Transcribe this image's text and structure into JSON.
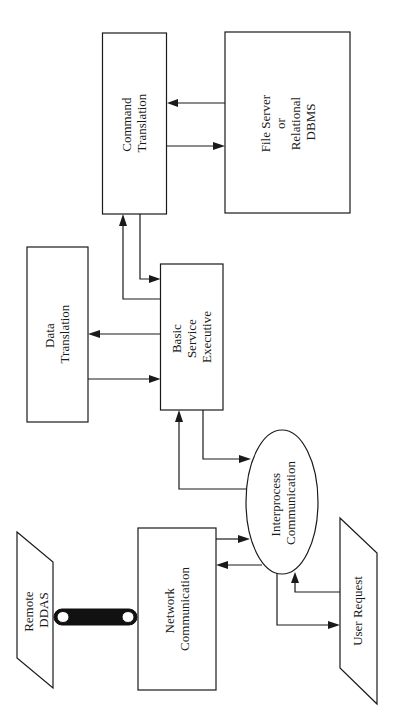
{
  "diagram": {
    "orientation": "rotated-90-ccw",
    "nodes": {
      "command_translation": {
        "lines": [
          "Command",
          "Translation"
        ],
        "shape": "rectangle"
      },
      "file_server": {
        "lines": [
          "File Server",
          "or",
          "Relational",
          "DBMS"
        ],
        "shape": "rectangle"
      },
      "data_translation": {
        "lines": [
          "Data",
          "Translation"
        ],
        "shape": "rectangle"
      },
      "basic_service_executive": {
        "lines": [
          "Basic",
          "Service",
          "Executive"
        ],
        "shape": "rectangle"
      },
      "interprocess_communication": {
        "lines": [
          "Interprocess",
          "Communication"
        ],
        "shape": "ellipse"
      },
      "network_communication": {
        "lines": [
          "Network",
          "Communication"
        ],
        "shape": "rectangle"
      },
      "remote_ddas": {
        "lines": [
          "Remote",
          "DDAS"
        ],
        "shape": "parallelogram"
      },
      "user_request": {
        "lines": [
          "User Request"
        ],
        "shape": "parallelogram"
      }
    },
    "edges": [
      {
        "from": "file_server",
        "to": "command_translation"
      },
      {
        "from": "command_translation",
        "to": "file_server"
      },
      {
        "from": "command_translation",
        "to": "basic_service_executive"
      },
      {
        "from": "basic_service_executive",
        "to": "command_translation"
      },
      {
        "from": "basic_service_executive",
        "to": "data_translation"
      },
      {
        "from": "data_translation",
        "to": "basic_service_executive"
      },
      {
        "from": "basic_service_executive",
        "to": "interprocess_communication"
      },
      {
        "from": "interprocess_communication",
        "to": "basic_service_executive"
      },
      {
        "from": "network_communication",
        "to": "interprocess_communication"
      },
      {
        "from": "interprocess_communication",
        "to": "network_communication"
      },
      {
        "from": "user_request",
        "to": "interprocess_communication"
      },
      {
        "from": "interprocess_communication",
        "to": "user_request"
      },
      {
        "from": "remote_ddas",
        "to": "network_communication",
        "type": "network-link"
      }
    ],
    "colors": {
      "stroke": "#1a1a1a",
      "background": "#ffffff"
    }
  }
}
